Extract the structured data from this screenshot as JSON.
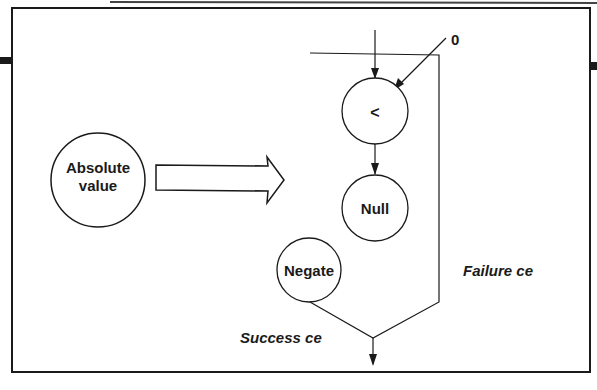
{
  "diagram": {
    "outer_frame": {
      "stroke": "#1a1a1a"
    },
    "source_node": {
      "label_line1": "Absolute",
      "label_line2": "value"
    },
    "transform_arrow": {
      "style": "hollow"
    },
    "nodes": {
      "compare": {
        "label": "<"
      },
      "null": {
        "label": "Null"
      },
      "negate": {
        "label": "Negate"
      }
    },
    "constant_input": {
      "label": "0"
    },
    "edges": {
      "success": {
        "label": "Success ce"
      },
      "failure": {
        "label": "Failure ce"
      }
    }
  }
}
